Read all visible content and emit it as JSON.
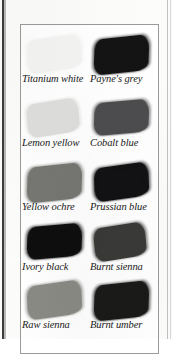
{
  "plate": {
    "title": "Oil paint colour swatch chart",
    "reproduction": "grayscale halftone scan",
    "columns": 2,
    "rows": 5
  },
  "chart_data": {
    "type": "table",
    "xlabel": "",
    "ylabel": "",
    "layout": "2 columns x 5 rows of painted brush strokes with italic captions",
    "categories": [
      "Titanium white",
      "Payne's grey",
      "Lemon yellow",
      "Cobalt blue",
      "Yellow ochre",
      "Prussian blue",
      "Ivory black",
      "Burnt sienna",
      "Raw sienna",
      "Burnt umber"
    ],
    "values": [
      4,
      92,
      13,
      72,
      55,
      93,
      95,
      78,
      48,
      90
    ],
    "note": "values are approximate ink darkness of each swatch, 0 = white paper, 100 = solid black"
  },
  "swatches": [
    {
      "label": "Titanium white",
      "column": "left",
      "row": 0,
      "swatch_color": "#f4f4f3",
      "darkness": 4
    },
    {
      "label": "Payne's grey",
      "column": "right",
      "row": 0,
      "swatch_color": "#141414",
      "darkness": 92
    },
    {
      "label": "Lemon yellow",
      "column": "left",
      "row": 1,
      "swatch_color": "#dedfdc",
      "darkness": 13
    },
    {
      "label": "Cobalt blue",
      "column": "right",
      "row": 1,
      "swatch_color": "#4b4b4d",
      "darkness": 72
    },
    {
      "label": "Yellow ochre",
      "column": "left",
      "row": 2,
      "swatch_color": "#767673",
      "darkness": 55
    },
    {
      "label": "Prussian blue",
      "column": "right",
      "row": 2,
      "swatch_color": "#121214",
      "darkness": 93
    },
    {
      "label": "Ivory black",
      "column": "left",
      "row": 3,
      "swatch_color": "#0e0e0e",
      "darkness": 95
    },
    {
      "label": "Burnt sienna",
      "column": "right",
      "row": 3,
      "swatch_color": "#3a3a38",
      "darkness": 78
    },
    {
      "label": "Raw sienna",
      "column": "left",
      "row": 4,
      "swatch_color": "#8a8a85",
      "darkness": 48
    },
    {
      "label": "Burnt umber",
      "column": "right",
      "row": 4,
      "swatch_color": "#1a1a19",
      "darkness": 90
    }
  ]
}
